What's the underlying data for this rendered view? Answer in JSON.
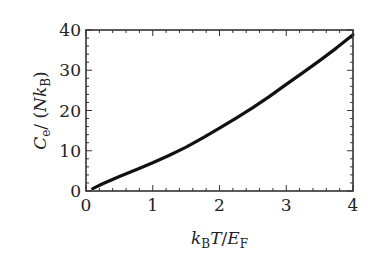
{
  "chart_data": {
    "type": "line",
    "title": "",
    "xlabel": "k_B T / E_F",
    "ylabel": "C_e / (N k_B)",
    "xlim": [
      0,
      4
    ],
    "ylim": [
      0,
      40
    ],
    "xticks": [
      0,
      1,
      2,
      3,
      4
    ],
    "yticks": [
      0,
      10,
      20,
      30,
      40
    ],
    "xtick_labels": [
      "0",
      "1",
      "2",
      "3",
      "4"
    ],
    "ytick_labels": [
      "0",
      "10",
      "20",
      "30",
      "40"
    ],
    "grid": false,
    "legend": null,
    "series": [
      {
        "name": "electronic heat capacity",
        "color": "#111111",
        "x": [
          0.1,
          0.25,
          0.5,
          0.75,
          1.0,
          1.25,
          1.5,
          1.75,
          2.0,
          2.25,
          2.5,
          2.75,
          3.0,
          3.25,
          3.5,
          3.75,
          4.0
        ],
        "y": [
          0.6,
          1.8,
          3.6,
          5.3,
          7.0,
          8.9,
          10.9,
          13.2,
          15.6,
          18.1,
          20.7,
          23.5,
          26.5,
          29.4,
          32.4,
          35.5,
          38.8
        ]
      }
    ]
  }
}
